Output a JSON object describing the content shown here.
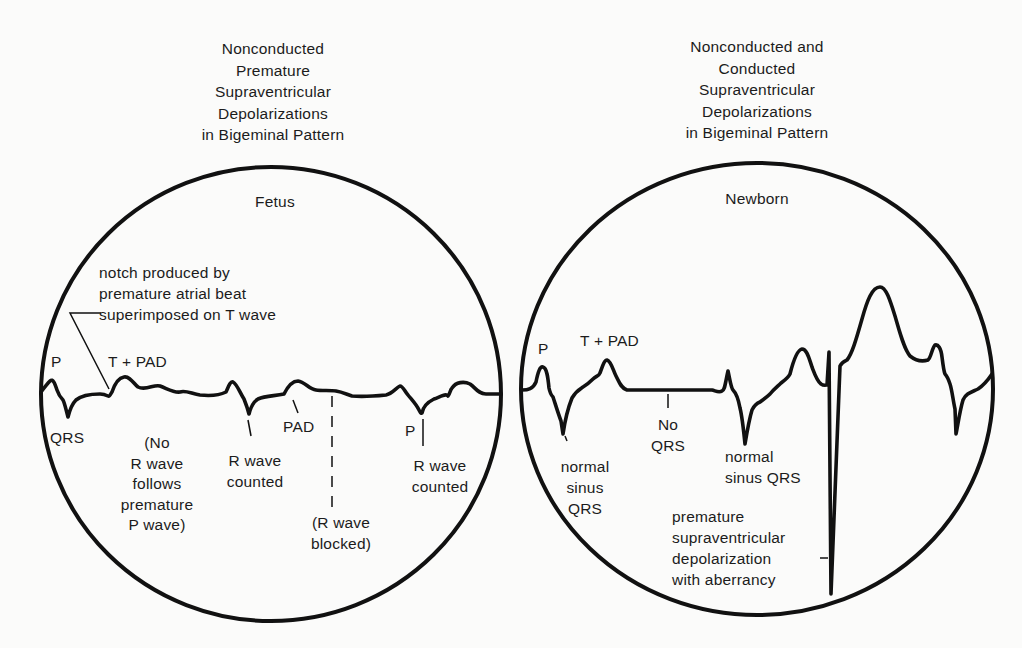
{
  "left_panel": {
    "title": "Nonconducted\nPremature\nSupraventricular\nDepolarizations\nin Bigeminal Pattern",
    "subject": "Fetus",
    "labels": {
      "notch": "notch produced by\npremature atrial beat\nsuperimposed on T wave",
      "p_wave": "P",
      "t_pad": "T + PAD",
      "qrs": "QRS",
      "no_r_wave": "(No\nR wave\nfollows\npremature\nP wave)",
      "r_wave_counted_1": "R wave\ncounted",
      "pad": "PAD",
      "r_wave_blocked": "(R wave\nblocked)",
      "p_wave_2": "P",
      "r_wave_counted_2": "R wave\ncounted"
    }
  },
  "right_panel": {
    "title": "Nonconducted and\nConducted\nSupraventricular\nDepolarizations\nin Bigeminal Pattern",
    "subject": "Newborn",
    "labels": {
      "p_wave": "P",
      "t_pad": "T + PAD",
      "no_qrs": "No\nQRS",
      "normal_sinus_qrs_1": "normal\nsinus\nQRS",
      "normal_sinus_qrs_2": "normal\nsinus QRS",
      "aberrant": "premature\nsupraventricular\ndepolarization\nwith aberrancy"
    }
  },
  "colors": {
    "background": "#fbfbfa",
    "ink": "#111111",
    "text": "#1c1c1c"
  }
}
